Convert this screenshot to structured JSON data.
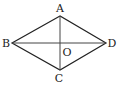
{
  "diagram": {
    "type": "rhombus",
    "points": {
      "A": {
        "label": "A",
        "x": 60,
        "y": 16
      },
      "B": {
        "label": "B",
        "x": 12,
        "y": 43
      },
      "C": {
        "label": "C",
        "x": 60,
        "y": 70
      },
      "D": {
        "label": "D",
        "x": 106,
        "y": 43
      },
      "O": {
        "label": "O",
        "x": 60,
        "y": 43
      }
    },
    "segments": [
      "AB",
      "BC",
      "CD",
      "DA",
      "AC",
      "BD"
    ],
    "colors": {
      "stroke": "#222222",
      "diagonal": "#444444"
    }
  }
}
